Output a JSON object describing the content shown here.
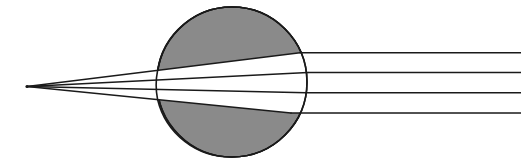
{
  "figure": {
    "name": "spherical-lens-ray-diagram",
    "title": "Refraction of parallel rays by a sphere to a focal point",
    "width": 521,
    "height": 163,
    "background_color": "#ffffff"
  },
  "colors": {
    "sphere_fill": "#8a8a8a",
    "sphere_stroke": "#1a1a1a",
    "beam_fill": "#ffffff",
    "ray_stroke": "#1a1a1a",
    "background": "#ffffff"
  },
  "sphere": {
    "label": "refracting-sphere",
    "center_x": 232,
    "center_y": 82,
    "radius": 75,
    "stroke_width": 1.6,
    "fill": "#8a8a8a"
  },
  "focal_point": {
    "label": "focal-point",
    "x": 27,
    "y": 86.5
  },
  "chart_data": {
    "type": "line",
    "title": "Refraction of parallel rays by a sphere to a focal point",
    "xlabel": "",
    "ylabel": "",
    "xlim": [
      0,
      521
    ],
    "ylim": [
      0,
      163
    ],
    "grid": false,
    "legend": "none",
    "annotations": [
      "Four parallel rays enter from the right at equal spacing",
      "Rays refract at the spherical surface and converge at a focal point on the left",
      "The unshaded (white) lens-shaped region is the swept beam envelope inside and outside the sphere"
    ],
    "series": [
      {
        "name": "ray-1-top",
        "entry_y": 52.8,
        "x": [
          521,
          300,
          27
        ],
        "y": [
          52.8,
          52.8,
          86.5
        ]
      },
      {
        "name": "ray-2-upper-middle",
        "entry_y": 72.6,
        "x": [
          521,
          308,
          27
        ],
        "y": [
          72.6,
          72.6,
          86.5
        ]
      },
      {
        "name": "ray-3-lower-middle",
        "entry_y": 92.8,
        "x": [
          521,
          306,
          27
        ],
        "y": [
          92.8,
          92.8,
          86.5
        ]
      },
      {
        "name": "ray-4-bottom",
        "entry_y": 113.0,
        "x": [
          521,
          291,
          27
        ],
        "y": [
          113.0,
          113.0,
          86.5
        ]
      }
    ]
  },
  "geometry": {
    "beam_envelope_note": "white-beam-region",
    "incoming_rays_note": "incoming-parallel-rays",
    "converging_rays_note": "converging-refracted-rays"
  }
}
